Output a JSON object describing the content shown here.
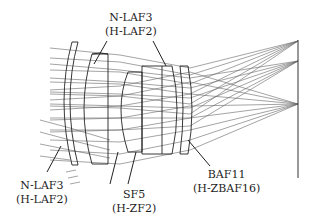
{
  "diagram": {
    "type": "optical-lens-raytrace",
    "colors": {
      "lens": "#222222",
      "ray": "#555555",
      "leader": "#222222",
      "text": "#1e1e1e",
      "image_plane": "#333333"
    },
    "labels": [
      {
        "id": "top",
        "line1": "N-LAF3",
        "line2": "(H-LAF2)"
      },
      {
        "id": "bottom-left",
        "line1": "N-LAF3",
        "line2": "(H-LAF2)"
      },
      {
        "id": "bottom-middle",
        "line1": "SF5",
        "line2": "(H-ZF2)"
      },
      {
        "id": "bottom-right",
        "line1": "BAF11",
        "line2": "(H-ZBAF16)"
      }
    ]
  }
}
